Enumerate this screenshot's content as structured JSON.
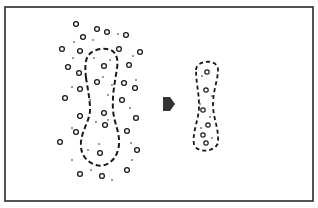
{
  "diagram": {
    "colors": {
      "background": "#ffffff",
      "ink": "#1a1a1a",
      "arrow": "#333333",
      "frame": "#2a2a2a"
    },
    "left_panel": {
      "outline": "dashed-dumbbell",
      "circles": [
        [
          76,
          24
        ],
        [
          97,
          29
        ],
        [
          107,
          32
        ],
        [
          126,
          35
        ],
        [
          83,
          37
        ],
        [
          119,
          49
        ],
        [
          62,
          49
        ],
        [
          80,
          51
        ],
        [
          140,
          52
        ],
        [
          68,
          67
        ],
        [
          104,
          66
        ],
        [
          129,
          65
        ],
        [
          79,
          73
        ],
        [
          97,
          82
        ],
        [
          124,
          83
        ],
        [
          80,
          89
        ],
        [
          135,
          88
        ],
        [
          65,
          98
        ],
        [
          122,
          100
        ],
        [
          80,
          116
        ],
        [
          104,
          113
        ],
        [
          136,
          118
        ],
        [
          76,
          132
        ],
        [
          105,
          125
        ],
        [
          127,
          131
        ],
        [
          60,
          142
        ],
        [
          100,
          153
        ],
        [
          137,
          150
        ],
        [
          80,
          174
        ],
        [
          102,
          176
        ],
        [
          127,
          170
        ]
      ],
      "dots": [
        [
          118,
          34
        ],
        [
          74,
          42
        ],
        [
          93,
          40
        ],
        [
          133,
          56
        ],
        [
          73,
          58
        ],
        [
          94,
          58
        ],
        [
          110,
          60
        ],
        [
          103,
          77
        ],
        [
          136,
          80
        ],
        [
          72,
          87
        ],
        [
          112,
          85
        ],
        [
          90,
          100
        ],
        [
          108,
          95
        ],
        [
          130,
          108
        ],
        [
          96,
          122
        ],
        [
          72,
          128
        ],
        [
          108,
          120
        ],
        [
          131,
          143
        ],
        [
          88,
          150
        ],
        [
          99,
          144
        ],
        [
          132,
          160
        ],
        [
          72,
          160
        ],
        [
          112,
          180
        ],
        [
          91,
          170
        ]
      ]
    },
    "arrow": {
      "direction": "right",
      "shape": "pentagon-arrow"
    },
    "right_panel": {
      "outline": "dashed-capsule",
      "circles": [
        [
          207,
          72
        ],
        [
          206,
          90
        ],
        [
          203,
          110
        ],
        [
          208,
          125
        ],
        [
          203,
          135
        ],
        [
          206,
          143
        ]
      ],
      "dots": [
        [
          202,
          76
        ],
        [
          212,
          96
        ],
        [
          200,
          104
        ],
        [
          210,
          117
        ],
        [
          201,
          128
        ],
        [
          212,
          138
        ]
      ]
    }
  }
}
